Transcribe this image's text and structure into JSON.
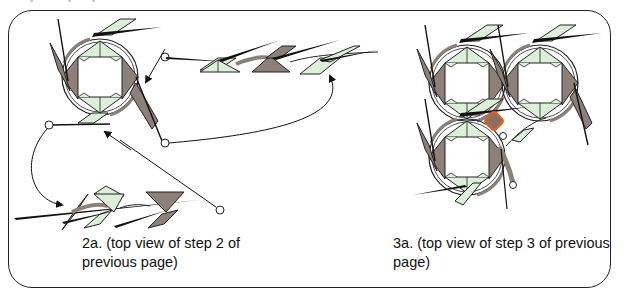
{
  "figure": {
    "type": "origami-instruction-diagram",
    "panels": [
      {
        "id": "2a",
        "caption": "2a. (top view of step 2 of previous page)",
        "caption_lines": [
          "2a. (top view of step 2 of",
          "previous page)"
        ],
        "elements": [
          "ring-module",
          "unit-strip-top",
          "unit-strip-bottom",
          "arrows",
          "reference-circles"
        ]
      },
      {
        "id": "3a",
        "caption": "3a. (top view of step 3 of previous page)",
        "caption_lines": [
          "3a. (top view of step 3 of previous",
          "page)"
        ],
        "elements": [
          "three-ring-cluster",
          "highlighted-square-marker",
          "reference-circles"
        ]
      }
    ]
  },
  "colors": {
    "dark_paper": "#8c8079",
    "light_paper": "#dcefd8",
    "outline": "#222222",
    "highlight_stroke": "#d9622b",
    "highlight_fill": "#8a6f66",
    "frame": "#222222"
  }
}
